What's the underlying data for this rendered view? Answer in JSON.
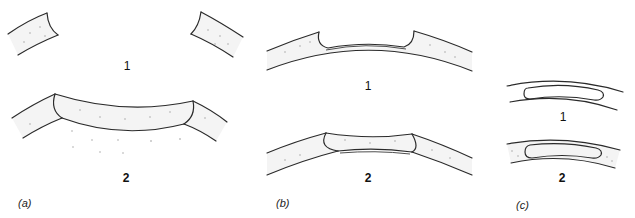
{
  "figure": {
    "panels": [
      {
        "id": "a",
        "label": "(a)",
        "stages": [
          {
            "number": "1",
            "description": "corneal trephination defect with cut edges"
          },
          {
            "number": "2",
            "description": "full-thickness donor graft sutured in recipient bed"
          }
        ]
      },
      {
        "id": "b",
        "label": "(b)",
        "stages": [
          {
            "number": "1",
            "description": "lamellar dissection leaving thin posterior lamina"
          },
          {
            "number": "2",
            "description": "lamellar graft placed in recipient bed"
          }
        ]
      },
      {
        "id": "c",
        "label": "(c)",
        "stages": [
          {
            "number": "1",
            "description": "intrastromal pocket"
          },
          {
            "number": "2",
            "description": "intrastromal pocket with filled stroma"
          }
        ]
      }
    ]
  }
}
